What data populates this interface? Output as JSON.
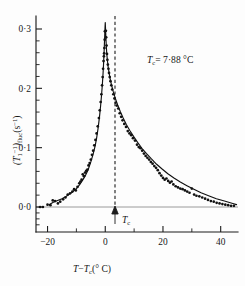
{
  "figure": {
    "background_color": "#fdfdfd",
    "ink_color": "#111111",
    "zero_line_color": "#9a9a9a"
  },
  "annotations": {
    "tc_value_label": "= 7·88 °C",
    "tc_symbol": "T",
    "tc_subscript": "c",
    "tc_axis_marker_symbol": "T",
    "tc_axis_marker_subscript": "c"
  },
  "yaxis": {
    "label_main": "(T",
    "label_sub1": "1",
    "label_sup1": "−1",
    "label_mid": ")",
    "label_sub2": "fluc",
    "label_tail": "(s",
    "label_sup2": "−1",
    "label_close": ")",
    "tick_labels": [
      "0·3",
      "0·2",
      "0·1",
      "0·0"
    ],
    "tick_values": [
      0.3,
      0.2,
      0.1,
      0.0
    ],
    "minor_ticks_per_interval": 4
  },
  "xaxis": {
    "label_t": "T",
    "label_minus": "−",
    "label_tc": "T",
    "label_tc_sub": "c",
    "label_units": "(° C)",
    "tick_labels": [
      "−20",
      "0",
      "20",
      "40"
    ],
    "tick_values": [
      -20,
      0,
      20,
      40
    ],
    "minor_tick_values": [
      -10,
      10,
      30
    ]
  },
  "chart_data": {
    "type": "scatter",
    "title": "",
    "subtitle": "",
    "xlabel": "T − Tc (° C)",
    "ylabel": "(T1^-1)fluc (s^-1)",
    "xlim": [
      -24,
      46
    ],
    "ylim": [
      -0.02,
      0.31
    ],
    "grid": false,
    "legend": null,
    "annotation": "Tc = 7·88 °C",
    "critical_temperature_c": 7.88,
    "series": [
      {
        "name": "fluctuation relaxation rate data",
        "marker": "filled-circle",
        "points": [
          [
            -22.6,
            0.0
          ],
          [
            -21.6,
            0.0
          ],
          [
            -20.0,
            0.004
          ],
          [
            -19.0,
            0.003
          ],
          [
            -18.2,
            0.011
          ],
          [
            -17.4,
            0.01
          ],
          [
            -16.4,
            0.006
          ],
          [
            -15.6,
            0.009
          ],
          [
            -14.6,
            0.013
          ],
          [
            -13.8,
            0.016
          ],
          [
            -13.0,
            0.021
          ],
          [
            -12.2,
            0.023
          ],
          [
            -11.4,
            0.026
          ],
          [
            -10.8,
            0.03
          ],
          [
            -10.2,
            0.028
          ],
          [
            -9.6,
            0.034
          ],
          [
            -9.0,
            0.04
          ],
          [
            -8.6,
            0.043
          ],
          [
            -8.2,
            0.046
          ],
          [
            -7.8,
            0.055
          ],
          [
            -7.4,
            0.052
          ],
          [
            -7.0,
            0.058
          ],
          [
            -6.6,
            0.061
          ],
          [
            -6.2,
            0.063
          ],
          [
            -5.8,
            0.07
          ],
          [
            -5.4,
            0.074
          ],
          [
            -5.0,
            0.08
          ],
          [
            -4.6,
            0.088
          ],
          [
            -4.2,
            0.095
          ],
          [
            -3.8,
            0.104
          ],
          [
            -3.4,
            0.113
          ],
          [
            -3.0,
            0.124
          ],
          [
            -2.6,
            0.136
          ],
          [
            -2.2,
            0.15
          ],
          [
            -1.9,
            0.163
          ],
          [
            -1.6,
            0.177
          ],
          [
            -1.35,
            0.19
          ],
          [
            -1.1,
            0.205
          ],
          [
            -0.9,
            0.219
          ],
          [
            -0.75,
            0.233
          ],
          [
            -0.6,
            0.246
          ],
          [
            -0.48,
            0.254
          ],
          [
            -0.38,
            0.259
          ],
          [
            -0.3,
            0.268
          ],
          [
            -0.2,
            0.282
          ],
          [
            -0.12,
            0.296
          ],
          [
            0.22,
            0.297
          ],
          [
            0.32,
            0.286
          ],
          [
            0.45,
            0.272
          ],
          [
            0.6,
            0.258
          ],
          [
            0.75,
            0.248
          ],
          [
            0.9,
            0.24
          ],
          [
            1.1,
            0.233
          ],
          [
            1.3,
            0.226
          ],
          [
            1.55,
            0.219
          ],
          [
            1.8,
            0.212
          ],
          [
            2.1,
            0.205
          ],
          [
            2.4,
            0.198
          ],
          [
            2.8,
            0.19
          ],
          [
            3.2,
            0.183
          ],
          [
            3.6,
            0.176
          ],
          [
            4.0,
            0.171
          ],
          [
            4.5,
            0.166
          ],
          [
            5.0,
            0.158
          ],
          [
            5.5,
            0.152
          ],
          [
            6.0,
            0.146
          ],
          [
            6.6,
            0.14
          ],
          [
            7.2,
            0.135
          ],
          [
            7.8,
            0.128
          ],
          [
            8.4,
            0.124
          ],
          [
            9.0,
            0.121
          ],
          [
            9.6,
            0.116
          ],
          [
            10.3,
            0.112
          ],
          [
            11.0,
            0.105
          ],
          [
            11.6,
            0.101
          ],
          [
            12.2,
            0.099
          ],
          [
            12.8,
            0.095
          ],
          [
            13.4,
            0.09
          ],
          [
            14.0,
            0.086
          ],
          [
            14.6,
            0.083
          ],
          [
            15.2,
            0.08
          ],
          [
            15.8,
            0.076
          ],
          [
            16.4,
            0.073
          ],
          [
            17.0,
            0.069
          ],
          [
            17.6,
            0.066
          ],
          [
            18.2,
            0.062
          ],
          [
            18.8,
            0.057
          ],
          [
            19.4,
            0.053
          ],
          [
            20.0,
            0.049
          ],
          [
            20.6,
            0.046
          ],
          [
            21.2,
            0.048
          ],
          [
            21.8,
            0.044
          ],
          [
            22.4,
            0.041
          ],
          [
            23.0,
            0.043
          ],
          [
            23.6,
            0.038
          ],
          [
            24.4,
            0.035
          ],
          [
            25.2,
            0.033
          ],
          [
            26.0,
            0.031
          ],
          [
            26.8,
            0.03
          ],
          [
            27.6,
            0.028
          ],
          [
            28.4,
            0.026
          ],
          [
            29.2,
            0.024
          ],
          [
            30.0,
            0.031
          ],
          [
            30.8,
            0.021
          ],
          [
            31.6,
            0.019
          ],
          [
            32.6,
            0.018
          ],
          [
            33.6,
            0.016
          ],
          [
            34.6,
            0.014
          ],
          [
            35.6,
            0.012
          ],
          [
            36.6,
            0.01
          ],
          [
            37.6,
            0.009
          ],
          [
            38.6,
            0.007
          ],
          [
            39.6,
            0.006
          ],
          [
            40.6,
            0.005
          ],
          [
            41.6,
            0.004
          ],
          [
            42.6,
            0.003
          ],
          [
            43.6,
            0.002
          ],
          [
            44.6,
            0.002
          ]
        ]
      }
    ],
    "fit_curve": {
      "name": "critical divergence fit",
      "points": [
        [
          -19.5,
          0.004
        ],
        [
          -18.0,
          0.008
        ],
        [
          -16.5,
          0.011
        ],
        [
          -15.0,
          0.014
        ],
        [
          -13.5,
          0.018
        ],
        [
          -12.0,
          0.023
        ],
        [
          -11.0,
          0.027
        ],
        [
          -10.0,
          0.031
        ],
        [
          -9.0,
          0.037
        ],
        [
          -8.0,
          0.044
        ],
        [
          -7.0,
          0.052
        ],
        [
          -6.0,
          0.062
        ],
        [
          -5.0,
          0.076
        ],
        [
          -4.2,
          0.089
        ],
        [
          -3.5,
          0.103
        ],
        [
          -3.0,
          0.116
        ],
        [
          -2.5,
          0.132
        ],
        [
          -2.0,
          0.152
        ],
        [
          -1.6,
          0.171
        ],
        [
          -1.3,
          0.188
        ],
        [
          -1.0,
          0.207
        ],
        [
          -0.8,
          0.222
        ],
        [
          -0.6,
          0.24
        ],
        [
          -0.45,
          0.256
        ],
        [
          -0.3,
          0.274
        ],
        [
          -0.18,
          0.29
        ],
        [
          -0.08,
          0.303
        ],
        [
          0.0,
          0.311
        ],
        [
          0.1,
          0.3
        ],
        [
          0.2,
          0.288
        ],
        [
          0.35,
          0.272
        ],
        [
          0.5,
          0.26
        ],
        [
          0.7,
          0.249
        ],
        [
          0.95,
          0.238
        ],
        [
          1.3,
          0.227
        ],
        [
          1.7,
          0.216
        ],
        [
          2.2,
          0.205
        ],
        [
          2.8,
          0.194
        ],
        [
          3.5,
          0.183
        ],
        [
          4.3,
          0.172
        ],
        [
          5.2,
          0.161
        ],
        [
          6.2,
          0.15
        ],
        [
          7.3,
          0.139
        ],
        [
          8.5,
          0.129
        ],
        [
          9.8,
          0.119
        ],
        [
          11.2,
          0.109
        ],
        [
          12.7,
          0.099
        ],
        [
          14.3,
          0.09
        ],
        [
          16.0,
          0.081
        ],
        [
          17.8,
          0.072
        ],
        [
          19.7,
          0.064
        ],
        [
          21.7,
          0.056
        ],
        [
          23.8,
          0.049
        ],
        [
          26.0,
          0.042
        ],
        [
          28.3,
          0.036
        ],
        [
          30.7,
          0.03
        ],
        [
          33.2,
          0.024
        ],
        [
          35.8,
          0.019
        ],
        [
          38.5,
          0.014
        ],
        [
          41.3,
          0.01
        ],
        [
          44.2,
          0.006
        ],
        [
          45.5,
          0.004
        ]
      ]
    }
  }
}
